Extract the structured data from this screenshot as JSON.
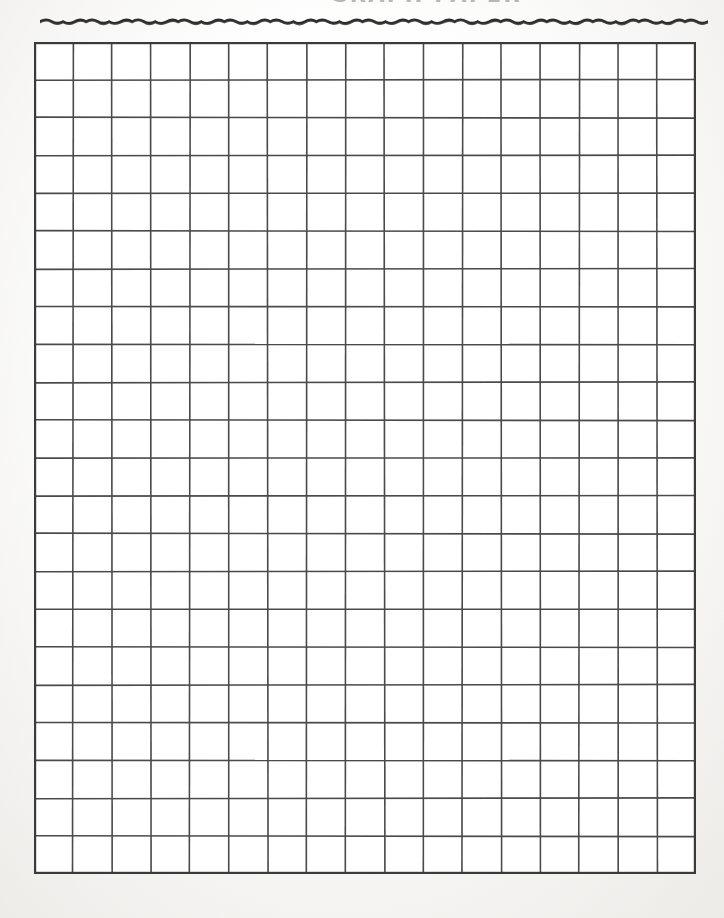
{
  "page": {
    "width": 724,
    "height": 918,
    "background_color": "#fdfdfc",
    "document_type": "graph-paper-worksheet",
    "orientation": "portrait"
  },
  "header": {
    "title": "GRAPH PAPER",
    "title_clipped": true,
    "title_color": "#b9b7b5",
    "divider": {
      "name": "wavy-rule",
      "style": "hand-drawn zigzag wave",
      "color": "#2b2b2b",
      "left": 40,
      "top": 9,
      "width": 668,
      "height": 22,
      "wave_count": 29
    }
  },
  "grid": {
    "columns": 17,
    "rows": 22,
    "cell_width": 38.9,
    "cell_height": 37.8,
    "left": 34,
    "top": 42,
    "width": 662,
    "height": 832,
    "line_color": "#4a4a4a",
    "line_width": 1.6,
    "border_color": "#3a3a3a",
    "border_width": 2.2,
    "cell_fill": "#ffffff",
    "total_cells": 374
  }
}
